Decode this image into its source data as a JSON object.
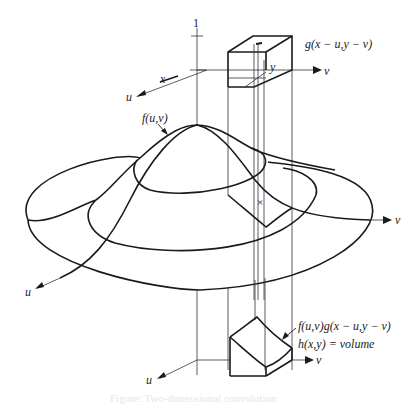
{
  "figure": {
    "top_axes": {
      "tick_label": "1",
      "x_label": "x",
      "u_label": "u",
      "v_label": "v",
      "y_label": "y"
    },
    "kernel_label": "g(x − u,y − v)",
    "surface_label": "f(u,v)",
    "middle_axes": {
      "u_label": "u",
      "v_label": "v"
    },
    "bottom_axes": {
      "u_label": "u",
      "v_label": "v"
    },
    "product_label": "f(u,v)g(x − u,y − v)",
    "volume_label": "h(x,y) = volume",
    "caption": "Figure: Two-dimensional convolution"
  },
  "colors": {
    "line": "#1a1a1a",
    "background": "#ffffff"
  }
}
